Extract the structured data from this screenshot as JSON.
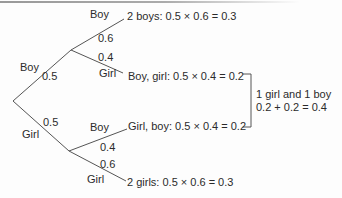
{
  "tree": {
    "level1": [
      {
        "label": "Boy",
        "probability": "0.5"
      },
      {
        "label": "Girl",
        "probability": "0.5"
      }
    ],
    "level2": [
      {
        "label": "Boy",
        "probability": "0.6",
        "outcome": "2 boys: 0.5 × 0.6 = 0.3"
      },
      {
        "label": "Girl",
        "probability": "0.4",
        "outcome": "Boy, girl: 0.5 × 0.4 = 0.2"
      },
      {
        "label": "Boy",
        "probability": "0.4",
        "outcome": "Girl, boy: 0.5 × 0.4 = 0.2"
      },
      {
        "label": "Girl",
        "probability": "0.6",
        "outcome": "2 girls: 0.5 × 0.6 = 0.3"
      }
    ],
    "bracket_note": {
      "line1": "1 girl and 1 boy",
      "line2": "0.2 + 0.2 = 0.4"
    },
    "colors": {
      "text": "#2b2b2b",
      "line": "#555555"
    }
  }
}
